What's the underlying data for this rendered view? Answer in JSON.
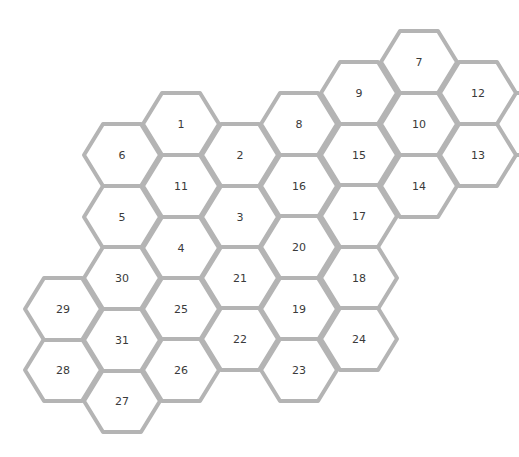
{
  "diagram": {
    "type": "hexagon-grid",
    "stroke_color": "#b4b4b4",
    "fill_color": "#ffffff",
    "text_color": "#3a3a3a",
    "hex_half_width": 38,
    "hex_half_height": 31,
    "cells": [
      {
        "label": "1",
        "cx": 181,
        "cy": 124
      },
      {
        "label": "2",
        "cx": 240,
        "cy": 155
      },
      {
        "label": "3",
        "cx": 240,
        "cy": 217
      },
      {
        "label": "4",
        "cx": 181,
        "cy": 248
      },
      {
        "label": "5",
        "cx": 122,
        "cy": 217
      },
      {
        "label": "6",
        "cx": 122,
        "cy": 155
      },
      {
        "label": "7",
        "cx": 419,
        "cy": 62
      },
      {
        "label": "8",
        "cx": 299,
        "cy": 124
      },
      {
        "label": "9",
        "cx": 359,
        "cy": 93
      },
      {
        "label": "10",
        "cx": 419,
        "cy": 124
      },
      {
        "label": "11",
        "cx": 181,
        "cy": 186
      },
      {
        "label": "12",
        "cx": 478,
        "cy": 93
      },
      {
        "label": "13",
        "cx": 478,
        "cy": 155
      },
      {
        "label": "14",
        "cx": 419,
        "cy": 186
      },
      {
        "label": "15",
        "cx": 359,
        "cy": 155
      },
      {
        "label": "16",
        "cx": 299,
        "cy": 186
      },
      {
        "label": "17",
        "cx": 359,
        "cy": 216
      },
      {
        "label": "18",
        "cx": 359,
        "cy": 278
      },
      {
        "label": "19",
        "cx": 299,
        "cy": 309
      },
      {
        "label": "20",
        "cx": 299,
        "cy": 247
      },
      {
        "label": "21",
        "cx": 240,
        "cy": 278
      },
      {
        "label": "22",
        "cx": 240,
        "cy": 339
      },
      {
        "label": "23",
        "cx": 299,
        "cy": 370
      },
      {
        "label": "24",
        "cx": 359,
        "cy": 339
      },
      {
        "label": "25",
        "cx": 181,
        "cy": 309
      },
      {
        "label": "26",
        "cx": 181,
        "cy": 370
      },
      {
        "label": "27",
        "cx": 122,
        "cy": 401
      },
      {
        "label": "28",
        "cx": 63,
        "cy": 370
      },
      {
        "label": "29",
        "cx": 63,
        "cy": 309
      },
      {
        "label": "30",
        "cx": 122,
        "cy": 278
      },
      {
        "label": "31",
        "cx": 122,
        "cy": 340
      }
    ],
    "edge_stubs": [
      {
        "x1": 516,
        "y1": 93,
        "x2": 522,
        "y2": 93
      },
      {
        "x1": 516,
        "y1": 155,
        "x2": 522,
        "y2": 155
      }
    ]
  }
}
